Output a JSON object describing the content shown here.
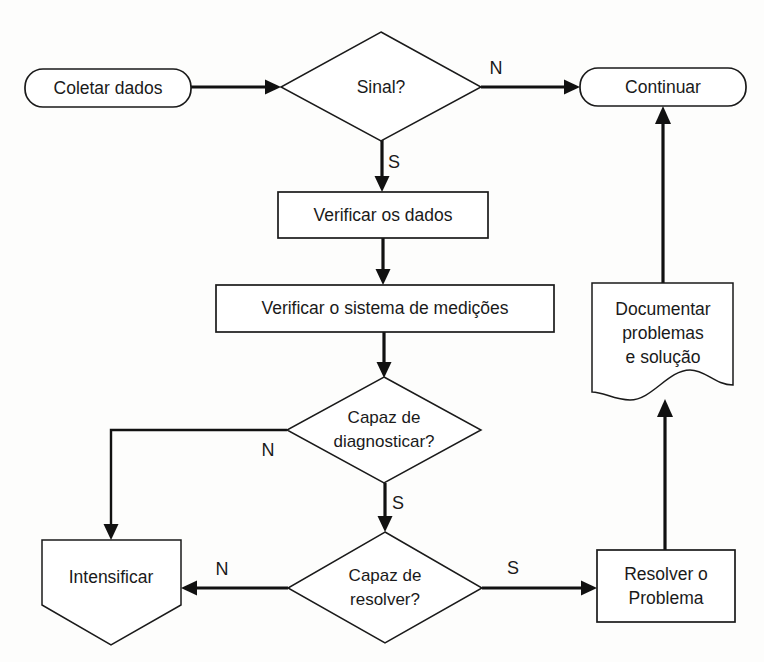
{
  "diagram": {
    "type": "flowchart",
    "language": "pt-BR",
    "background_color": "#fdfdfc",
    "line_color": "#111111",
    "shape_fill": "#ffffff",
    "nodes": [
      {
        "id": "coletar",
        "label": "Coletar dados",
        "shape": "rounded-rectangle",
        "x": 25,
        "y": 69,
        "w": 166,
        "h": 38
      },
      {
        "id": "sinal",
        "label": "Sinal?",
        "shape": "diamond",
        "cx": 381,
        "cy": 86,
        "rx": 100,
        "ry": 54
      },
      {
        "id": "continuar",
        "label": "Continuar",
        "shape": "rounded-rectangle",
        "x": 580,
        "y": 68,
        "w": 166,
        "h": 38
      },
      {
        "id": "verificar-dados",
        "label": "Verificar os dados",
        "shape": "rectangle",
        "x": 278,
        "y": 192,
        "w": 210,
        "h": 46
      },
      {
        "id": "verificar-sistema",
        "label": "Verificar o sistema de medições",
        "shape": "rectangle",
        "x": 216,
        "y": 285,
        "w": 338,
        "h": 47
      },
      {
        "id": "diagnosticar",
        "label_line1": "Capaz de",
        "label_line2": "diagnosticar?",
        "shape": "diamond",
        "cx": 384,
        "cy": 430,
        "rx": 97,
        "ry": 53
      },
      {
        "id": "resolver-q",
        "label_line1": "Capaz de",
        "label_line2": "resolver?",
        "shape": "diamond",
        "cx": 385,
        "cy": 587,
        "rx": 97,
        "ry": 55
      },
      {
        "id": "intensificar",
        "label": "Intensificar",
        "shape": "pentagon-down",
        "x": 42,
        "y": 540,
        "w": 139,
        "h": 105
      },
      {
        "id": "resolver-problema",
        "label_line1": "Resolver o",
        "label_line2": "Problema",
        "shape": "rectangle",
        "x": 597,
        "y": 550,
        "w": 138,
        "h": 72
      },
      {
        "id": "documentar",
        "label_line1": "Documentar",
        "label_line2": "problemas",
        "label_line3": "e solução",
        "shape": "document",
        "x": 592,
        "y": 283,
        "w": 141,
        "h": 117
      }
    ],
    "edges": [
      {
        "id": "e1",
        "from": "coletar",
        "to": "sinal",
        "label": ""
      },
      {
        "id": "e2",
        "from": "sinal",
        "to": "continuar",
        "label": "N"
      },
      {
        "id": "e3",
        "from": "sinal",
        "to": "verificar-dados",
        "label": "S"
      },
      {
        "id": "e4",
        "from": "verificar-dados",
        "to": "verificar-sistema",
        "label": ""
      },
      {
        "id": "e5",
        "from": "verificar-sistema",
        "to": "diagnosticar",
        "label": ""
      },
      {
        "id": "e6",
        "from": "diagnosticar",
        "to": "intensificar",
        "label": "N"
      },
      {
        "id": "e7",
        "from": "diagnosticar",
        "to": "resolver-q",
        "label": "S"
      },
      {
        "id": "e8",
        "from": "resolver-q",
        "to": "intensificar",
        "label": "N"
      },
      {
        "id": "e9",
        "from": "resolver-q",
        "to": "resolver-problema",
        "label": "S"
      },
      {
        "id": "e10",
        "from": "resolver-problema",
        "to": "documentar",
        "label": ""
      },
      {
        "id": "e11",
        "from": "documentar",
        "to": "continuar",
        "label": ""
      }
    ],
    "edge_labels": {
      "sinal_no": "N",
      "sinal_yes": "S",
      "diagnosticar_no": "N",
      "diagnosticar_yes": "S",
      "resolver_no": "N",
      "resolver_yes": "S"
    }
  }
}
